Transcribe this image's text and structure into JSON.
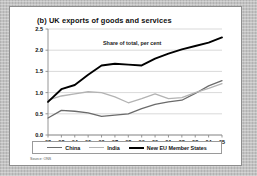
{
  "figure": {
    "title": "(b) UK exports of goods and services",
    "subtitle": "Share of total, per cent",
    "source": "Source: ONS"
  },
  "chart_data": {
    "type": "line",
    "title": "(b) UK exports of goods and services",
    "subtitle": "Share of total, per cent",
    "xlabel": "",
    "ylabel": "Share of total, per cent",
    "ylim": [
      0.0,
      2.5
    ],
    "yticks": [
      0.0,
      0.5,
      1.0,
      1.5,
      2.0,
      2.5
    ],
    "ytick_labels": [
      "0.0",
      "0.5",
      "1.0",
      "1.5",
      "2.0",
      "2.5"
    ],
    "grid": true,
    "legend_position": "bottom",
    "categories": [
      "92",
      "93",
      "94",
      "95",
      "96",
      "97",
      "98",
      "99",
      "00",
      "01",
      "02",
      "03",
      "04",
      "05"
    ],
    "x": [
      1992,
      1993,
      1994,
      1995,
      1996,
      1997,
      1998,
      1999,
      2000,
      2001,
      2002,
      2003,
      2004,
      2005
    ],
    "series": [
      {
        "name": "China",
        "color": "#6b6b6b",
        "width": 1.3,
        "values": [
          0.4,
          0.58,
          0.56,
          0.52,
          0.44,
          0.47,
          0.5,
          0.62,
          0.72,
          0.78,
          0.82,
          0.98,
          1.16,
          1.28
        ]
      },
      {
        "name": "India",
        "color": "#b3b3b3",
        "width": 1.3,
        "values": [
          0.82,
          0.92,
          0.97,
          1.02,
          1.0,
          0.9,
          0.76,
          0.86,
          0.97,
          0.86,
          0.88,
          1.0,
          1.1,
          1.21
        ]
      },
      {
        "name": "New EU Member States",
        "color": "#000000",
        "width": 1.9,
        "values": [
          0.78,
          1.08,
          1.18,
          1.42,
          1.64,
          1.68,
          1.66,
          1.64,
          1.8,
          1.92,
          2.02,
          2.1,
          2.18,
          2.3
        ]
      }
    ]
  },
  "legend": {
    "items": [
      {
        "label": "China",
        "color": "#6b6b6b",
        "thickness": "1.4px"
      },
      {
        "label": "India",
        "color": "#b3b3b3",
        "thickness": "1.4px"
      },
      {
        "label": "New EU Member States",
        "color": "#000000",
        "thickness": "2px"
      }
    ]
  },
  "colors": {
    "card_background": "#ffffff",
    "mat_background": "#c2c2c2",
    "grid": "#cfcfcf",
    "axis": "#8a8a8a",
    "text": "#101010"
  }
}
